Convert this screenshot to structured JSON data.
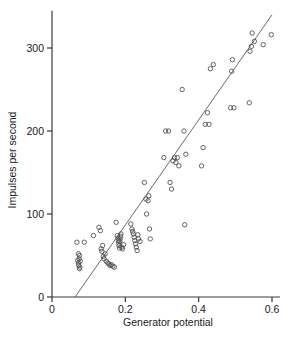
{
  "figure": {
    "background": "#ffffff",
    "marker_color": "#4a4a4a",
    "line_color": "#5a5a5a",
    "axis_color": "#3a3a3a"
  },
  "chart_data": {
    "type": "scatter",
    "title": "",
    "xlabel": "Generator potential",
    "ylabel": "Impulses per second",
    "xlim": [
      0,
      0.6
    ],
    "ylim": [
      0,
      345
    ],
    "xticks": [
      0,
      0.2,
      0.4,
      0.6
    ],
    "xticklabels": [
      "0",
      "0.2",
      "0.4",
      "0.6"
    ],
    "yticks": [
      0,
      100,
      200,
      300
    ],
    "yticklabels": [
      "0",
      "100",
      "200",
      "300"
    ],
    "grid": false,
    "legend": null,
    "marker": "open-circle",
    "series": [
      {
        "name": "observations",
        "x": [
          0.07,
          0.072,
          0.073,
          0.074,
          0.075,
          0.076,
          0.077,
          0.072,
          0.075,
          0.068,
          0.088,
          0.113,
          0.128,
          0.132,
          0.134,
          0.136,
          0.138,
          0.14,
          0.142,
          0.145,
          0.148,
          0.152,
          0.155,
          0.158,
          0.162,
          0.166,
          0.17,
          0.175,
          0.178,
          0.18,
          0.181,
          0.182,
          0.183,
          0.184,
          0.185,
          0.186,
          0.187,
          0.188,
          0.19,
          0.192,
          0.195,
          0.215,
          0.218,
          0.22,
          0.222,
          0.224,
          0.226,
          0.228,
          0.23,
          0.232,
          0.234,
          0.236,
          0.24,
          0.252,
          0.256,
          0.258,
          0.262,
          0.264,
          0.266,
          0.268,
          0.305,
          0.31,
          0.318,
          0.322,
          0.326,
          0.33,
          0.334,
          0.338,
          0.342,
          0.346,
          0.355,
          0.36,
          0.362,
          0.365,
          0.408,
          0.412,
          0.418,
          0.424,
          0.428,
          0.432,
          0.44,
          0.487,
          0.49,
          0.492,
          0.496,
          0.538,
          0.54,
          0.544,
          0.546,
          0.552,
          0.576,
          0.598
        ],
        "y": [
          44,
          41,
          38,
          46,
          50,
          36,
          43,
          52,
          34,
          66,
          66,
          74,
          84,
          80,
          58,
          55,
          62,
          49,
          46,
          52,
          43,
          41,
          40,
          38,
          39,
          37,
          36,
          90,
          74,
          71,
          68,
          65,
          62,
          59,
          67,
          70,
          73,
          76,
          60,
          58,
          63,
          88,
          82,
          79,
          76,
          72,
          68,
          64,
          60,
          56,
          75,
          70,
          67,
          138,
          118,
          100,
          116,
          122,
          82,
          70,
          168,
          200,
          200,
          138,
          130,
          164,
          168,
          162,
          168,
          158,
          250,
          200,
          87,
          172,
          158,
          180,
          208,
          222,
          208,
          275,
          280,
          228,
          272,
          286,
          228,
          234,
          296,
          302,
          318,
          308,
          304,
          316
        ]
      }
    ],
    "fit_line": {
      "x_start": 0.063,
      "y_start": 0,
      "x_end": 0.6,
      "y_end": 340
    }
  }
}
